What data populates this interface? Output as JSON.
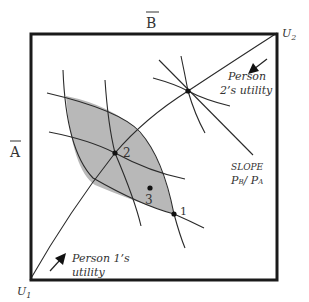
{
  "diagram": {
    "type": "edgeworth-box",
    "axis_labels": {
      "top": "B",
      "left": "A"
    },
    "origins": {
      "person1": {
        "label": "U",
        "subscript": "1"
      },
      "person2": {
        "label": "U",
        "subscript": "2"
      }
    },
    "annotations": {
      "person2_utility": [
        "Person",
        "2’s utility"
      ],
      "person1_utility": [
        "Person 1’s",
        "utility"
      ],
      "slope_label": "SLOPE",
      "slope_ratio": {
        "num": "P",
        "num_sub": "B",
        "sep": "/ ",
        "den": "P",
        "den_sub": "A"
      }
    },
    "points": [
      {
        "id": "1",
        "label": "1"
      },
      {
        "id": "2",
        "label": "2"
      },
      {
        "id": "3",
        "label": "3"
      }
    ],
    "colors": {
      "frame": "#1a1a1a",
      "lines": "#2a2a2a",
      "lens_fill": "#b8b8b8"
    }
  }
}
